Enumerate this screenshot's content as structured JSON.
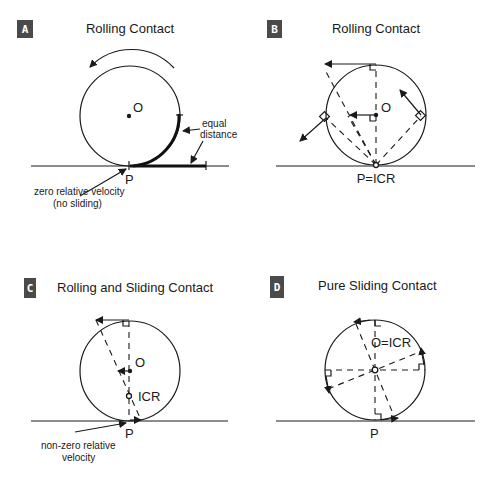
{
  "panels": {
    "a": {
      "badge": "A",
      "title": "Rolling Contact",
      "center_label": "O",
      "contact_label": "P",
      "equal_label_1": "equal",
      "equal_label_2": "distance",
      "note_1": "zero relative velocity",
      "note_2": "(no sliding)"
    },
    "b": {
      "badge": "B",
      "title": "Rolling Contact",
      "center_label": "O",
      "contact_label": "P=ICR"
    },
    "c": {
      "badge": "C",
      "title": "Rolling and Sliding Contact",
      "center_label": "O",
      "icr_label": "ICR",
      "contact_label": "P",
      "note_1": "non-zero relative",
      "note_2": "velocity"
    },
    "d": {
      "badge": "D",
      "title": "Pure Sliding Contact",
      "center_label": "O=ICR",
      "contact_label": "P"
    }
  },
  "colors": {
    "badge": "#4a4a4a",
    "ink": "#1a1a1a",
    "background": "#ffffff"
  }
}
